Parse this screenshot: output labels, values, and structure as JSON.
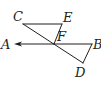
{
  "figure": {
    "type": "geometry",
    "points": {
      "A": "A",
      "B": "B",
      "C": "C",
      "D": "D",
      "E": "E",
      "F": "F"
    },
    "segments": [
      "CE",
      "EF",
      "CD",
      "FB",
      "BD"
    ],
    "ray": "FA",
    "color": "#231f20"
  }
}
